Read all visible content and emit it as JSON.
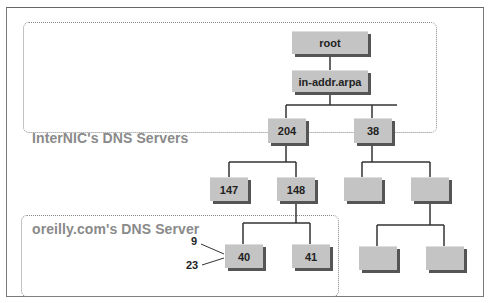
{
  "zones": {
    "internic": {
      "label": "InterNIC's DNS Servers"
    },
    "oreilly": {
      "label": "oreilly.com's DNS Server"
    }
  },
  "nodes": {
    "root": "root",
    "in_addr_arpa": "in-addr.arpa",
    "n204": "204",
    "n38": "38",
    "n147": "147",
    "n148": "148",
    "blank_a": "",
    "blank_b": "",
    "n40": "40",
    "n41": "41",
    "blank_c": "",
    "blank_d": ""
  },
  "annotations": {
    "a9": "9",
    "a23": "23"
  }
}
